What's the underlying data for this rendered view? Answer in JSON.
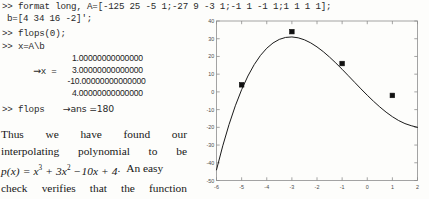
{
  "console": {
    "line1": ">> format long, A=[-125 25 -5 1;-27 9 -3 1;-1 1 -1 1;1 1 1 1];",
    "line2": "b=[4 34 16 -2]';",
    "line3": ">> flops(0);",
    "line4": ">> x=A\\b",
    "arrow": "→",
    "x_equals": "x =",
    "solution": [
      "1.00000000000000",
      "3.00000000000000",
      "-10.00000000000000",
      "4.00000000000000"
    ],
    "flops_cmd": ">> flops",
    "flops_result": "→ans =180"
  },
  "prose": {
    "line1": [
      "Thus",
      "we",
      "have",
      "found",
      "our"
    ],
    "line2": [
      "interpolating",
      "polynomial",
      "to",
      "be"
    ],
    "formula": {
      "lhs": "p(x) =",
      "term1": "x",
      "term1_exp": "3",
      "term2": "+ 3x",
      "term2_exp": "2",
      "term3": "−10x + 4",
      "period": ".",
      "tail": "An easy"
    },
    "line4": [
      "check",
      "verifies",
      "that",
      "the",
      "function"
    ]
  },
  "chart_data": {
    "type": "line",
    "title": "",
    "xlabel": "",
    "ylabel": "",
    "xlim": [
      -6,
      2
    ],
    "ylim": [
      -50,
      40
    ],
    "xticks": [
      -6,
      -5,
      -4,
      -3,
      -2,
      -1,
      0,
      1,
      2
    ],
    "yticks": [
      40,
      30,
      20,
      10,
      0,
      -10,
      -20,
      -30,
      -40,
      -50
    ],
    "grid": false,
    "legend": null,
    "line_color": "#1a1a1a",
    "marker_color": "#111111",
    "marker_style": "square",
    "series": [
      {
        "name": "p(x) = x^3 + 3x^2 - 10x + 4",
        "kind": "curve",
        "x": [
          -6,
          -5.75,
          -5.5,
          -5.25,
          -5,
          -4.75,
          -4.5,
          -4.25,
          -4,
          -3.75,
          -3.5,
          -3.25,
          -3,
          -2.75,
          -2.5,
          -2.25,
          -2,
          -1.75,
          -1.5,
          -1.25,
          -1,
          -0.75,
          -0.5,
          -0.25,
          0,
          0.25,
          0.5,
          0.75,
          1,
          1.25,
          1.5,
          1.75,
          2
        ],
        "y": [
          -44,
          -30.42,
          -18.38,
          -7.83,
          1.25,
          8.95,
          15.38,
          20.58,
          24.63,
          27.61,
          29.63,
          30.73,
          31,
          30.52,
          29.38,
          27.64,
          25.38,
          22.7,
          19.63,
          16.3,
          12.75,
          9.08,
          5.38,
          1.7,
          -1.88,
          -5.3,
          -8.5,
          -11.42,
          -14,
          -16.17,
          -17.88,
          -19.08,
          -20
        ]
      },
      {
        "name": "interpolation nodes",
        "kind": "points",
        "x": [
          -5,
          -3,
          -1,
          1
        ],
        "y": [
          4,
          34,
          16,
          -2
        ]
      }
    ]
  }
}
